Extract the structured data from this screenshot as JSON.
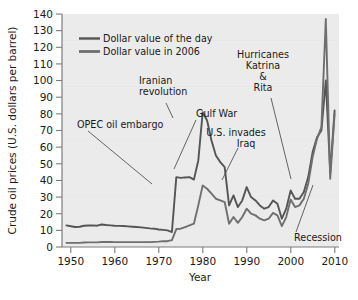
{
  "chart_data": {
    "type": "line",
    "title": "",
    "xlabel": "Year",
    "ylabel": "Crude oil prices (U.S. dollars per barrel)",
    "xlim": [
      1948,
      2011
    ],
    "ylim": [
      0,
      140
    ],
    "xticks": [
      "1950",
      "1960",
      "1970",
      "1980",
      "1990",
      "2000",
      "2010"
    ],
    "xtick_values": [
      1950,
      1960,
      1970,
      1980,
      1990,
      2000,
      2010
    ],
    "yticks": [
      "0",
      "10",
      "20",
      "30",
      "40",
      "50",
      "60",
      "70",
      "80",
      "90",
      "100",
      "110",
      "120",
      "130",
      "140"
    ],
    "ytick_values": [
      0,
      10,
      20,
      30,
      40,
      50,
      60,
      70,
      80,
      90,
      100,
      110,
      120,
      130,
      140
    ],
    "grid": false,
    "legend_position": "upper-left",
    "series": [
      {
        "name": "Dollar value of the day",
        "color": "#6f6f6f",
        "x": [
          1949,
          1950,
          1951,
          1952,
          1953,
          1954,
          1955,
          1956,
          1957,
          1958,
          1959,
          1960,
          1961,
          1962,
          1963,
          1964,
          1965,
          1966,
          1967,
          1968,
          1969,
          1970,
          1971,
          1972,
          1973,
          1974,
          1975,
          1976,
          1977,
          1978,
          1979,
          1980,
          1981,
          1982,
          1983,
          1984,
          1985,
          1986,
          1987,
          1988,
          1989,
          1990,
          1991,
          1992,
          1993,
          1994,
          1995,
          1996,
          1997,
          1998,
          1999,
          2000,
          2001,
          2002,
          2003,
          2004,
          2005,
          2006,
          2007,
          2008,
          2009,
          2010
        ],
        "values": [
          2.5,
          2.5,
          2.5,
          2.5,
          2.7,
          2.8,
          2.8,
          2.8,
          3.0,
          3.0,
          3.0,
          2.9,
          2.9,
          2.9,
          2.9,
          2.9,
          2.9,
          2.9,
          2.9,
          2.9,
          3.1,
          3.2,
          3.5,
          3.5,
          4.1,
          10.8,
          11.0,
          12.0,
          13.0,
          14.0,
          25.0,
          37.0,
          35.0,
          32.0,
          29.0,
          28.0,
          27.0,
          14.0,
          18.0,
          14.5,
          18.0,
          23.0,
          20.0,
          19.0,
          17.0,
          16.0,
          17.0,
          20.5,
          19.0,
          12.5,
          18.0,
          28.5,
          24.0,
          25.0,
          29.0,
          38.0,
          54.0,
          65.0,
          72.0,
          137.0,
          41.0,
          80.0
        ]
      },
      {
        "name": "Dollar value in 2006",
        "color": "#5a5a5a",
        "x": [
          1949,
          1950,
          1951,
          1952,
          1953,
          1954,
          1955,
          1956,
          1957,
          1958,
          1959,
          1960,
          1961,
          1962,
          1963,
          1964,
          1965,
          1966,
          1967,
          1968,
          1969,
          1970,
          1971,
          1972,
          1973,
          1974,
          1975,
          1976,
          1977,
          1978,
          1979,
          1980,
          1981,
          1982,
          1983,
          1984,
          1985,
          1986,
          1987,
          1988,
          1989,
          1990,
          1991,
          1992,
          1993,
          1994,
          1995,
          1996,
          1997,
          1998,
          1999,
          2000,
          2001,
          2002,
          2003,
          2004,
          2005,
          2006,
          2007,
          2008,
          2009,
          2010
        ],
        "values": [
          13.0,
          12.5,
          12.0,
          12.2,
          12.8,
          12.9,
          13.0,
          12.8,
          13.5,
          13.2,
          13.0,
          12.8,
          12.7,
          12.6,
          12.4,
          12.2,
          12.0,
          11.8,
          11.5,
          11.2,
          11.0,
          10.5,
          10.3,
          10.0,
          9.0,
          42.0,
          41.5,
          41.8,
          42.0,
          40.5,
          52.0,
          81.0,
          76.0,
          64.0,
          55.0,
          51.0,
          48.0,
          25.0,
          31.0,
          24.0,
          28.0,
          36.0,
          30.0,
          28.0,
          25.0,
          23.0,
          24.0,
          28.0,
          26.0,
          17.0,
          23.0,
          34.0,
          29.0,
          29.0,
          33.0,
          42.0,
          57.0,
          66.0,
          70.0,
          100.0,
          45.0,
          82.0
        ]
      }
    ],
    "annotations": [
      {
        "id": "opec-oil-embargo",
        "lines": [
          "OPEC oil embargo"
        ],
        "align": "start"
      },
      {
        "id": "iranian-revolution",
        "lines": [
          "Iranian",
          "revolution"
        ],
        "align": "start"
      },
      {
        "id": "gulf-war",
        "lines": [
          "Gulf War"
        ],
        "align": "start"
      },
      {
        "id": "us-invades-iraq",
        "lines": [
          "U.S. invades",
          "Iraq"
        ],
        "align": "middle"
      },
      {
        "id": "hurricanes-katrina-rita",
        "lines": [
          "Hurricanes",
          "Katrina",
          "&",
          "Rita"
        ],
        "align": "middle"
      },
      {
        "id": "recession",
        "lines": [
          "Recession"
        ],
        "align": "start"
      }
    ]
  },
  "legend": {
    "items": [
      {
        "label": "Dollar value of the day"
      },
      {
        "label": "Dollar value in 2006"
      }
    ]
  },
  "axes": {
    "y_title": "Crude oil prices (U.S. dollars per barrel)",
    "x_title": "Year",
    "y_labels": [
      "140",
      "130",
      "120",
      "110",
      "100",
      "90",
      "80",
      "70",
      "60",
      "50",
      "40",
      "30",
      "20",
      "10",
      "0"
    ],
    "x_labels": [
      "1950",
      "1960",
      "1970",
      "1980",
      "1990",
      "2000",
      "2010"
    ]
  },
  "annotations": {
    "opec": "OPEC oil embargo",
    "iranian_1": "Iranian",
    "iranian_2": "revolution",
    "gulf_war": "Gulf War",
    "iraq_1": "U.S. invades",
    "iraq_2": "Iraq",
    "katrina_1": "Hurricanes",
    "katrina_2": "Katrina",
    "katrina_3": "&",
    "katrina_4": "Rita",
    "recession": "Recession"
  },
  "colors": {
    "plot_background": "#ebebeb",
    "line_nominal": "#6f6f6f",
    "line_real": "#555555",
    "axis": "#7d7d7d",
    "text": "#1a1a1a"
  }
}
